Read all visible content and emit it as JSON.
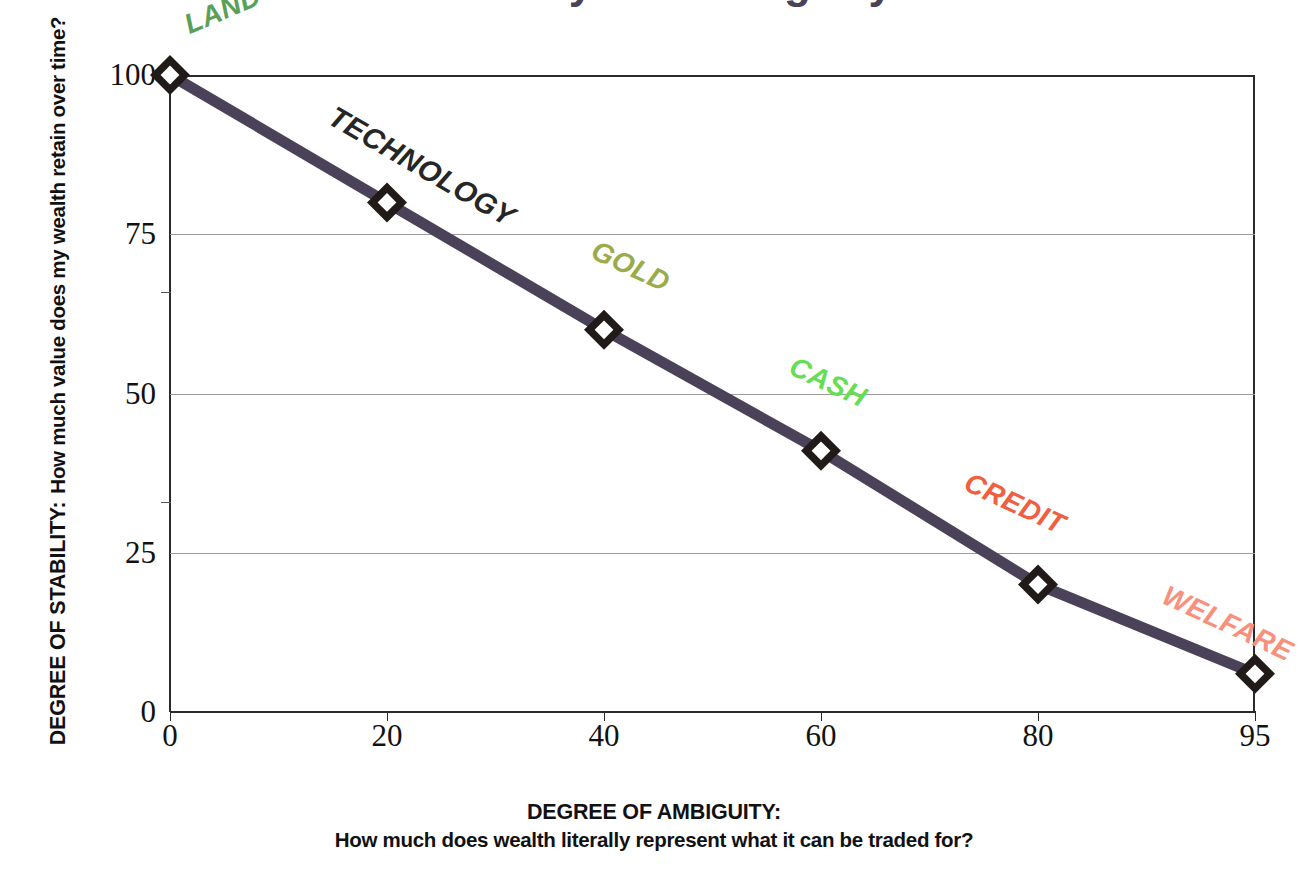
{
  "title_partial": "Stability vs Ambiguity",
  "axes": {
    "y": {
      "title_line1": "DEGREE OF STABILITY:",
      "title_line2": "How much value does my wealth retain over time?",
      "ticks": [
        "100",
        "75",
        "50",
        "25",
        "0"
      ]
    },
    "x": {
      "title_line1": "DEGREE OF AMBIGUITY:",
      "title_line2": "How much does wealth literally represent what it can be traded for?",
      "ticks": [
        "0",
        "20",
        "40",
        "60",
        "80",
        "95"
      ]
    }
  },
  "colors": {
    "line": "#4a4258",
    "marker": "#201a18",
    "grid": "#9b9b9b",
    "axis": "#2a2a2a",
    "land": "#5aa05a",
    "technology": "#262626",
    "gold": "#9aab4a",
    "cash": "#66dd55",
    "credit": "#f0603f",
    "welfare": "#f8907b"
  },
  "chart_data": {
    "type": "line",
    "title": "Stability vs Ambiguity",
    "xlabel": "DEGREE OF AMBIGUITY: How much does wealth literally represent what it can be traded for?",
    "ylabel": "DEGREE OF STABILITY: How much value does my wealth retain over time?",
    "x": [
      0,
      20,
      40,
      60,
      80,
      95
    ],
    "xticklabels": [
      "0",
      "20",
      "40",
      "60",
      "80",
      "95"
    ],
    "values": [
      100,
      80,
      60,
      41,
      20,
      6
    ],
    "point_labels": [
      "LAND",
      "TECHNOLOGY",
      "GOLD",
      "CASH",
      "CREDIT",
      "WELFARE"
    ],
    "point_label_colors": [
      "#5aa05a",
      "#262626",
      "#9aab4a",
      "#66dd55",
      "#f0603f",
      "#f8907b"
    ],
    "ylim": [
      0,
      100
    ],
    "yticks": [
      0,
      25,
      50,
      75,
      100
    ],
    "grid": true,
    "legend": "none",
    "marker": "hollow-diamond",
    "series": [
      {
        "name": "stability",
        "values": [
          100,
          80,
          60,
          41,
          20,
          6
        ]
      }
    ]
  },
  "annotations": [
    {
      "text": "LAND",
      "color": "#5aa05a",
      "x": 186,
      "y": 10,
      "rotate": -23,
      "size": 28
    },
    {
      "text": "TECHNOLOGY",
      "color": "#262626",
      "x": 331,
      "y": 98,
      "rotate": 30,
      "size": 29
    },
    {
      "text": "GOLD",
      "color": "#9aab4a",
      "x": 593,
      "y": 233,
      "rotate": 25,
      "size": 28
    },
    {
      "text": "CASH",
      "color": "#66dd55",
      "x": 791,
      "y": 349,
      "rotate": 25,
      "size": 28
    },
    {
      "text": "CREDIT",
      "color": "#f0603f",
      "x": 966,
      "y": 465,
      "rotate": 25,
      "size": 28
    },
    {
      "text": "WELFARE",
      "color": "#f8907b",
      "x": 1164,
      "y": 578,
      "rotate": 25,
      "size": 28
    }
  ]
}
